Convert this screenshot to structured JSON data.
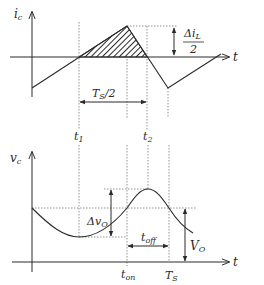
{
  "figure": {
    "top_plot": {
      "y_axis_label": "i",
      "y_axis_sub": "c",
      "x_axis_label": "t",
      "delta_label_num": "Δi",
      "delta_label_num_sub": "L",
      "delta_label_den": "2",
      "half_period_label": "T",
      "half_period_sub": "S",
      "half_period_suffix": "/2",
      "t1_label": "t",
      "t1_sub": "1",
      "t2_label": "t",
      "t2_sub": "2"
    },
    "bottom_plot": {
      "y_axis_label": "v",
      "y_axis_sub": "c",
      "x_axis_label": "t",
      "ripple_label": "Δv",
      "ripple_sub": "O",
      "toff_label": "t",
      "toff_sub": "off",
      "vo_label": "V",
      "vo_sub": "O",
      "ton_label": "t",
      "ton_sub": "on",
      "ts_label": "T",
      "ts_sub": "S"
    },
    "colors": {
      "line": "#2a2a2a",
      "dashed": "#666666",
      "background": "#ffffff"
    }
  }
}
